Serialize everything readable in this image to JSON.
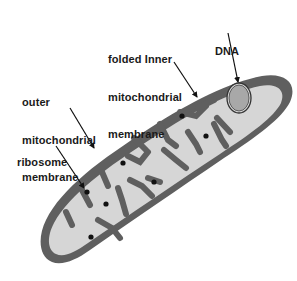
{
  "diagram": {
    "labels": {
      "inner_membrane": [
        "folded Inner",
        "mitochondrial",
        "membrane"
      ],
      "dna": "DNA",
      "outer_membrane": [
        "outer",
        "mitochondrial",
        "membrane"
      ],
      "ribosome": "ribosome"
    },
    "colors": {
      "outer_membrane": "#5f5f5f",
      "matrix": "#d6d6d6",
      "dna_fill": "#a8a8a8",
      "ribosome": "#111111",
      "text": "#1a1a1a",
      "background": "#ffffff"
    },
    "ribosome_count": 7
  }
}
